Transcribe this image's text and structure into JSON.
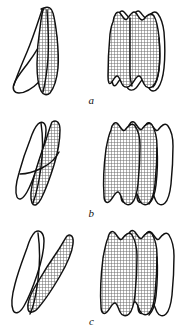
{
  "figure": {
    "background_color": "#ffffff",
    "outline_color": "#111111",
    "hatch_fill_color": "#8f8f8f",
    "white_fill_color": "#ffffff",
    "rows": [
      {
        "label": "a",
        "left_panel": {
          "name": "lateral-outline-superimposition-a",
          "shapes": [
            {
              "name": "outline-unshaded",
              "fill": "white"
            },
            {
              "name": "outline-shaded",
              "fill": "crosshatch"
            }
          ]
        },
        "right_panel": {
          "name": "occlusal-outline-superimposition-a",
          "shapes": [
            {
              "name": "outline-unshaded",
              "fill": "white"
            },
            {
              "name": "outline-shaded",
              "fill": "crosshatch"
            }
          ]
        }
      },
      {
        "label": "b",
        "left_panel": {
          "name": "lateral-outline-superimposition-b",
          "shapes": [
            {
              "name": "outline-unshaded",
              "fill": "white"
            },
            {
              "name": "outline-shaded",
              "fill": "crosshatch"
            }
          ]
        },
        "right_panel": {
          "name": "occlusal-outline-superimposition-b",
          "shapes": [
            {
              "name": "outline-unshaded",
              "fill": "white"
            },
            {
              "name": "outline-shaded-left",
              "fill": "crosshatch"
            },
            {
              "name": "outline-shaded-right",
              "fill": "crosshatch"
            }
          ]
        }
      },
      {
        "label": "c",
        "left_panel": {
          "name": "lateral-outline-superimposition-c",
          "shapes": [
            {
              "name": "outline-unshaded",
              "fill": "white"
            },
            {
              "name": "outline-shaded",
              "fill": "crosshatch"
            }
          ]
        },
        "right_panel": {
          "name": "occlusal-outline-superimposition-c",
          "shapes": [
            {
              "name": "outline-unshaded",
              "fill": "white"
            },
            {
              "name": "outline-shaded-left",
              "fill": "crosshatch"
            },
            {
              "name": "outline-shaded-right",
              "fill": "crosshatch"
            }
          ]
        }
      }
    ]
  }
}
